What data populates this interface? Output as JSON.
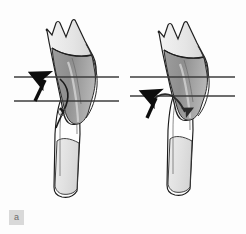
{
  "figure": {
    "panel_label": "a",
    "caption": "",
    "width": 246,
    "height": 234,
    "background_color": "#fdfdfd",
    "label_box_color": "#d9d9d9",
    "label_text_color": "#6a6a6a"
  },
  "colors": {
    "outline": "#1a1a1a",
    "outline_soft": "#4a4a4a",
    "crown_light": "#e8e8e8",
    "crown_mid": "#cfcfcf",
    "root_dark": "#8f8f8f",
    "root_mid": "#a8a8a8",
    "lower_tooth_fill": "#fefefe",
    "lower_root_fill": "#e2e2e2",
    "reference_line": "#3d3d3d",
    "arrow": "#0d0d0d"
  },
  "panels": [
    {
      "id": "left-panel",
      "name": "pre-eruption-stage",
      "upper_tooth": {
        "name": "upper-tooth-tilted",
        "crown_label": "",
        "root_label": ""
      },
      "lower_tooth": {
        "name": "lower-tooth",
        "crown_label": "",
        "root_label": ""
      },
      "reference_lines": [
        {
          "name": "occlusal-reference-line-upper",
          "y": 77
        },
        {
          "name": "occlusal-reference-line-lower",
          "y": 101
        }
      ],
      "arrows": [
        {
          "name": "upward-eruption-arrow",
          "direction": "up"
        },
        {
          "name": "curved-path-line",
          "direction": "curve"
        }
      ]
    },
    {
      "id": "right-panel",
      "name": "post-eruption-stage",
      "upper_tooth": {
        "name": "upper-tooth-tilted",
        "crown_label": "",
        "root_label": ""
      },
      "lower_tooth": {
        "name": "lower-tooth",
        "crown_label": "",
        "root_label": ""
      },
      "reference_lines": [
        {
          "name": "occlusal-reference-line-upper",
          "y": 77
        },
        {
          "name": "occlusal-reference-line-lower",
          "y": 96
        }
      ],
      "arrows": [
        {
          "name": "upward-eruption-arrow",
          "direction": "up"
        },
        {
          "name": "curved-rotation-arrow",
          "direction": "curve-down-right"
        }
      ]
    }
  ]
}
